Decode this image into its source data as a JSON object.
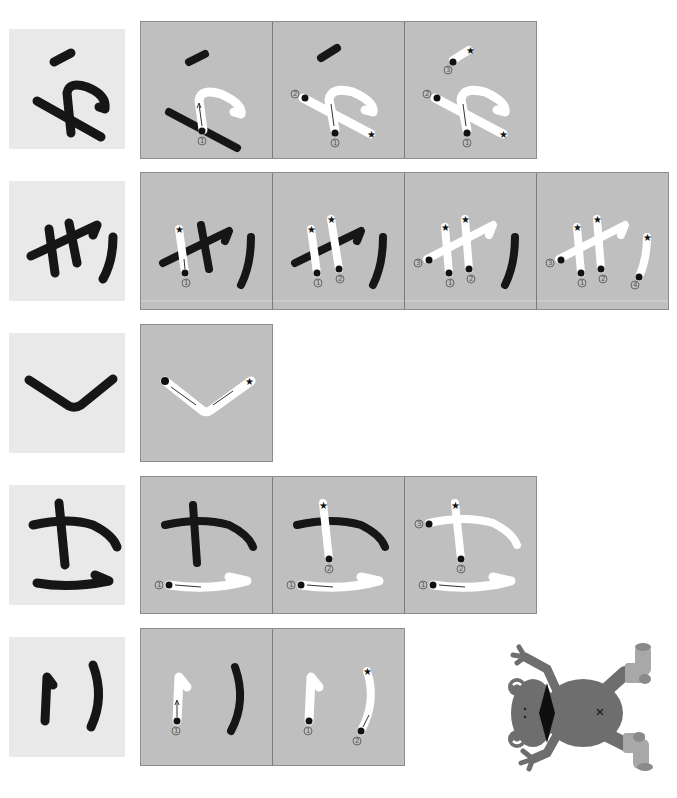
{
  "worksheet": {
    "title": "Hiragana stroke order",
    "orientation": "rotated-180"
  },
  "rows": [
    {
      "character": "か",
      "stroke_count": 3,
      "panel_count": 3,
      "step_numbers": [
        "1",
        "2",
        "3"
      ]
    },
    {
      "character": "き",
      "stroke_count": 4,
      "panel_count": 4,
      "step_numbers": [
        "1",
        "2",
        "3",
        "4"
      ]
    },
    {
      "character": "く",
      "stroke_count": 1,
      "panel_count": 1,
      "step_numbers": [
        "1"
      ]
    },
    {
      "character": "こ",
      "stroke_count": 3,
      "panel_count": 3,
      "step_numbers": [
        "1",
        "2",
        "3"
      ],
      "note": "displayed as さ-like form (こ upside down)"
    },
    {
      "character": "り",
      "stroke_count": 2,
      "panel_count": 2,
      "step_numbers": [
        "1",
        "2"
      ]
    }
  ],
  "markers": {
    "start": "filled-dot",
    "end": "star",
    "direction": "arrow",
    "number_style": "circled-digit"
  },
  "colors": {
    "page_bg": "#ffffff",
    "char_box_bg": "#e9e9e9",
    "panel_bg": "#bfbfbf",
    "panel_border": "#7b7b7b",
    "ink": "#161616",
    "trace": "#ffffff",
    "frog_body": "#6e6e6e",
    "frog_socks": "#a8a8a8"
  },
  "illustration": {
    "name": "frog-with-socks",
    "pose": "upside-down"
  }
}
